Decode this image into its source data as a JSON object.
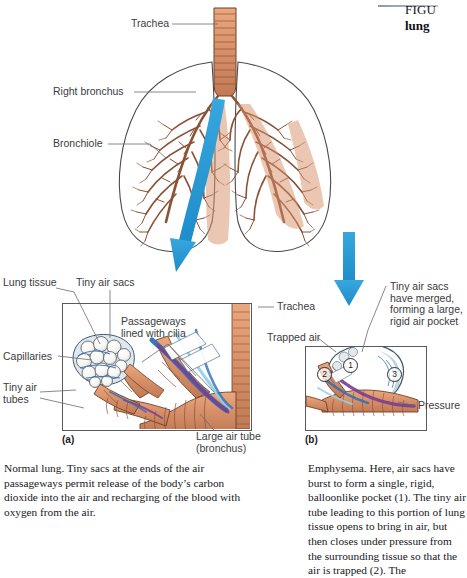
{
  "header": {
    "figure_number": "FIGU",
    "figure_word": "lung",
    "rule_color": "#8b9aaa"
  },
  "colors": {
    "arrow_blue": "#2c9ad8",
    "tissue_tan": "#d9916a",
    "bronchi_brown": "#8a5236",
    "vessel_blue": "#2f6fb5",
    "vessel_purple": "#7b3f8f",
    "alveoli_white": "#fdfdfd",
    "outline": "#3a3a3e",
    "label_text": "#3b3b40"
  },
  "top_figure": {
    "name": "whole-lungs-diagram",
    "labels": [
      {
        "id": "trachea",
        "text": "Trachea",
        "x": 131,
        "y": 21
      },
      {
        "id": "right-bronchus",
        "text": "Right bronchus",
        "x": 53,
        "y": 88
      },
      {
        "id": "bronchiole",
        "text": "Bronchiole",
        "x": 53,
        "y": 140
      }
    ]
  },
  "panel_a": {
    "name": "normal-lung-panel",
    "marker": "(a)",
    "labels": [
      {
        "id": "lung-tissue",
        "text": "Lung tissue",
        "x": 3,
        "y": 278
      },
      {
        "id": "tiny-air-sacs",
        "text": "Tiny air sacs",
        "x": 76,
        "y": 278
      },
      {
        "id": "capillaries",
        "text": "Capillaries",
        "x": 3,
        "y": 352
      },
      {
        "id": "tiny-air-tubes",
        "text": "Tiny air\ntubes",
        "x": 3,
        "y": 383
      },
      {
        "id": "passageways",
        "text": "Passageways\nlined with cilia",
        "x": 121,
        "y": 317
      },
      {
        "id": "large-air-tube",
        "text": "Large air tube\n(bronchus)",
        "x": 196,
        "y": 432
      },
      {
        "id": "trachea-a",
        "text": "Trachea",
        "x": 277,
        "y": 303
      }
    ]
  },
  "panel_b": {
    "name": "emphysema-panel",
    "marker": "(b)",
    "labels": [
      {
        "id": "tiny-air-sacs-merged",
        "text": "Tiny air sacs\nhave merged,\nforming a large,\nrigid air pocket",
        "x": 390,
        "y": 283
      },
      {
        "id": "trapped-air",
        "text": "Trapped air",
        "x": 267,
        "y": 334
      },
      {
        "id": "pressure",
        "text": "Pressure",
        "x": 418,
        "y": 402
      }
    ],
    "callouts": [
      {
        "id": "callout-1",
        "text": "1",
        "x": 349,
        "y": 364
      },
      {
        "id": "callout-2",
        "text": "2",
        "x": 323,
        "y": 373
      },
      {
        "id": "callout-3",
        "text": "3",
        "x": 393,
        "y": 373
      }
    ]
  },
  "captions": {
    "left": {
      "name": "normal-lung-caption",
      "text": "Normal lung. Tiny sacs at the ends of the air passageways permit release of the body’s carbon dioxide into the air and recharging of the blood with oxygen from the air."
    },
    "right": {
      "name": "emphysema-caption",
      "text": "Emphysema. Here, air sacs have burst to form a single, rigid, balloonlike pocket (1). The tiny air tube leading to this portion of lung tissue opens to bring in air, but then closes under pressure from the surrounding tissue so that the air is trapped (2). The"
    }
  },
  "arrows": [
    {
      "id": "arrow-to-panel-a",
      "direction": "down-curved"
    },
    {
      "id": "arrow-to-panel-b",
      "direction": "down-straight"
    }
  ]
}
